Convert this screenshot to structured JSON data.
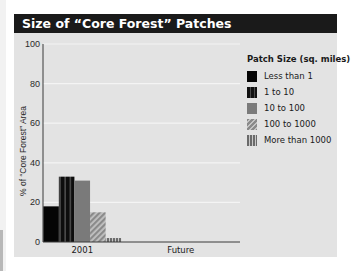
{
  "chart_data": {
    "type": "bar",
    "title": "Size of “Core Forest” Patches",
    "xlabel": "",
    "ylabel": "% of “Core Forest” Area",
    "ylim": [
      0,
      100
    ],
    "yticks": [
      0,
      20,
      40,
      60,
      80,
      100
    ],
    "grid": true,
    "categories": [
      "2001",
      "Future"
    ],
    "legend_title": "Patch Size (sq. miles)",
    "legend_position": "right",
    "series": [
      {
        "name": "Less than 1",
        "values": [
          18,
          null
        ],
        "color": "#050505",
        "pattern": "solid"
      },
      {
        "name": "1 to 10",
        "values": [
          33,
          null
        ],
        "color": "#111111",
        "pattern": "vertical-stripes"
      },
      {
        "name": "10 to 100",
        "values": [
          31,
          null
        ],
        "color": "#7a7a7a",
        "pattern": "solid"
      },
      {
        "name": "100 to 1000",
        "values": [
          15,
          null
        ],
        "color": "#8a8a8a",
        "pattern": "diagonal-hatch"
      },
      {
        "name": "More than 1000",
        "values": [
          2,
          null
        ],
        "color": "#6a6a6a",
        "pattern": "vertical-stripes"
      }
    ]
  }
}
